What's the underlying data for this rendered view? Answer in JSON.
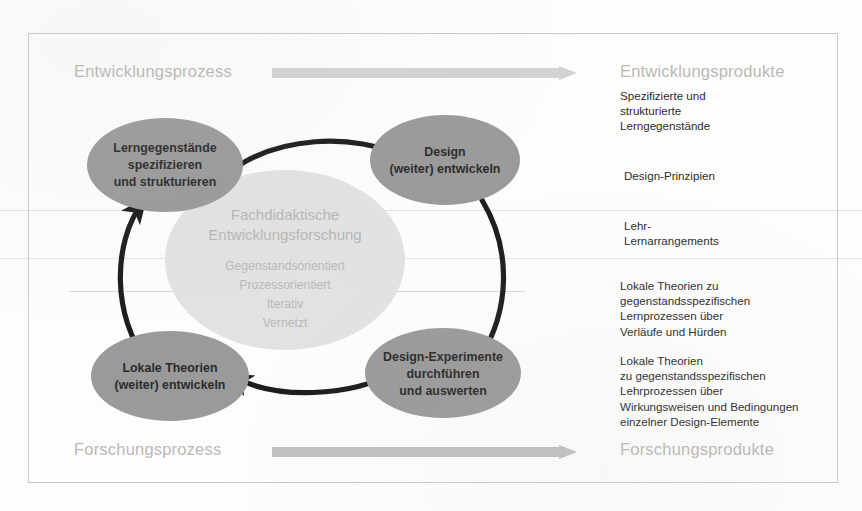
{
  "diagram": {
    "corner_labels": {
      "top_left": "Entwicklungsprozess",
      "top_right": "Entwicklungsprodukte",
      "bottom_left": "Forschungsprozess",
      "bottom_right": "Forschungsprodukte"
    },
    "center": {
      "title_line1": "Fachdidaktische",
      "title_line2": "Entwicklungsforschung",
      "items": [
        "Gegenstandsorientiert",
        "Prozessorientiert",
        "Iterativ",
        "Vernetzt"
      ]
    },
    "nodes": [
      {
        "id": "lerngegenstaende",
        "lines": [
          "Lerngegenstände",
          "spezifizieren",
          "und strukturieren"
        ]
      },
      {
        "id": "design-entwickeln",
        "lines": [
          "Design",
          "(weiter) entwickeln"
        ]
      },
      {
        "id": "design-experimente",
        "lines": [
          "Design-Experimente",
          "durchführen",
          "und auswerten"
        ]
      },
      {
        "id": "lokale-theorien",
        "lines": [
          "Lokale Theorien",
          "(weiter) entwickeln"
        ]
      }
    ],
    "products": [
      "Spezifizierte und\nstrukturierte\nLerngegenstände",
      "Design-Prinzipien",
      "Lehr-\nLernarrangements",
      "Lokale Theorien zu\ngegenstandsspezifischen\nLernprozessen über\nVerläufe und Hürden",
      "Lokale Theorien\nzu gegenstandsspezifischen\nLehrprozessen über\nWirkungsweisen und Bedingungen\neinzelner Design-Elemente"
    ],
    "colors": {
      "node_fill": "#9a9a9a",
      "center_fill": "#e2e2e2",
      "arrow_dark": "#1c1c1c",
      "arrow_light_top": "#d3d3d3",
      "arrow_light_bottom": "#c0c0c0",
      "frame_border": "#c9c9c9",
      "label_gray": "#b9b9b9"
    }
  }
}
